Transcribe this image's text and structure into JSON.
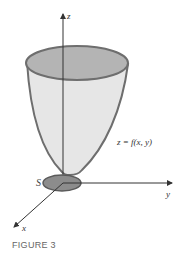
{
  "figure": {
    "caption": "FIGURE 3",
    "axes": {
      "x": "x",
      "y": "y",
      "z": "z"
    },
    "surface_label": "z = f(x, y)",
    "region_label": "S",
    "colors": {
      "surface_fill": "#e6e6e6",
      "surface_outline": "#6e6e6e",
      "top_ellipse_fill": "#b4b4b4",
      "region_fill": "#8c8c8c",
      "axis": "#333333"
    }
  }
}
